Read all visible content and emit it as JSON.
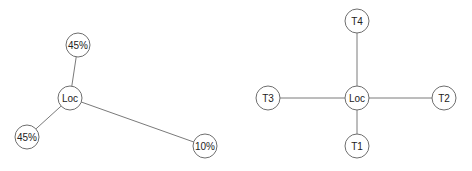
{
  "diagrams": [
    {
      "name": "probability-graph",
      "center": {
        "id": "loc",
        "label": "Loc",
        "x": 70,
        "y": 98
      },
      "nodes": [
        {
          "id": "p1",
          "label": "45%",
          "x": 78,
          "y": 45
        },
        {
          "id": "p2",
          "label": "45%",
          "x": 27,
          "y": 137
        },
        {
          "id": "p3",
          "label": "10%",
          "x": 205,
          "y": 146
        }
      ],
      "edges": [
        [
          "loc",
          "p1"
        ],
        [
          "loc",
          "p2"
        ],
        [
          "loc",
          "p3"
        ]
      ]
    },
    {
      "name": "transition-graph",
      "center": {
        "id": "loc",
        "label": "Loc",
        "x": 357,
        "y": 98
      },
      "nodes": [
        {
          "id": "t4",
          "label": "T4",
          "x": 357,
          "y": 21
        },
        {
          "id": "t3",
          "label": "T3",
          "x": 268,
          "y": 98
        },
        {
          "id": "t2",
          "label": "T2",
          "x": 444,
          "y": 98
        },
        {
          "id": "t1",
          "label": "T1",
          "x": 357,
          "y": 146
        }
      ],
      "edges": [
        [
          "loc",
          "t4"
        ],
        [
          "loc",
          "t3"
        ],
        [
          "loc",
          "t2"
        ],
        [
          "loc",
          "t1"
        ]
      ]
    }
  ],
  "node_radius": 12
}
